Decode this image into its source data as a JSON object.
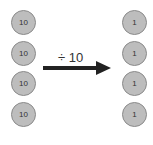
{
  "diagram": {
    "left_column": {
      "counters": [
        {
          "value": "10"
        },
        {
          "value": "10"
        },
        {
          "value": "10"
        },
        {
          "value": "10"
        }
      ]
    },
    "operation": {
      "label": "÷ 10",
      "arrow_direction": "right"
    },
    "right_column": {
      "counters": [
        {
          "value": "1"
        },
        {
          "value": "1"
        },
        {
          "value": "1"
        },
        {
          "value": "1"
        }
      ]
    },
    "colors": {
      "counter_fill": "#bdbdbd",
      "counter_border": "#8a8a8a",
      "arrow": "#222222"
    }
  }
}
